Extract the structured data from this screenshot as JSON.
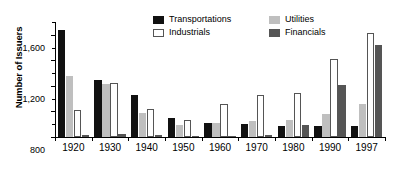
{
  "chart_data": {
    "type": "bar",
    "title": "",
    "subtitle": "",
    "xlabel": "",
    "ylabel": "Number of Issuers",
    "categories": [
      "1920",
      "1930",
      "1940",
      "1950",
      "1960",
      "1970",
      "1980",
      "1990",
      "1997"
    ],
    "series": [
      {
        "name": "Transportations",
        "color": "#111111",
        "values": [
          1670,
          895,
          655,
          290,
          220,
          205,
          180,
          175,
          170
        ]
      },
      {
        "name": "Utilities",
        "color": "#bfbfbf",
        "values": [
          960,
          825,
          370,
          185,
          225,
          250,
          265,
          355,
          510
        ]
      },
      {
        "name": "Industrials",
        "color": "#ffffff",
        "values": [
          420,
          850,
          445,
          270,
          515,
          655,
          685,
          1225,
          1625
        ]
      },
      {
        "name": "Financials",
        "color": "#555555",
        "values": [
          30,
          50,
          25,
          15,
          20,
          25,
          190,
          820,
          1440
        ]
      }
    ],
    "series_draw_order": [
      "Transportations",
      "Utilities",
      "Industrials",
      "Financials"
    ],
    "ylim": [
      0,
      1800
    ],
    "yticks": [
      0,
      400,
      800,
      1200,
      1600
    ],
    "ytick_labels": [
      "0",
      "400",
      "800",
      "1,200",
      "1,600"
    ],
    "yticks_minor": [
      200,
      600,
      1000,
      1400,
      1800
    ],
    "grid": false,
    "legend": {
      "position": "top-center",
      "entries": [
        {
          "label": "Transportations",
          "swatch": "transportations"
        },
        {
          "label": "Utilities",
          "swatch": "utilities"
        },
        {
          "label": "Industrials",
          "swatch": "industrials"
        },
        {
          "label": "Financials",
          "swatch": "financials"
        }
      ]
    }
  }
}
